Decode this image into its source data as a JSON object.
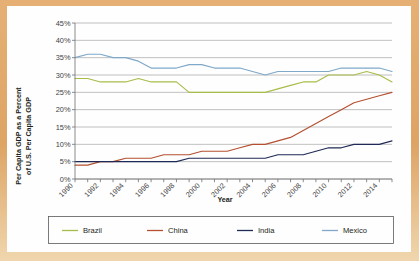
{
  "figure": {
    "background_color": "#e2ab71",
    "panel_color": "#fefefe",
    "ylabel_line1": "Per Capita GDP as a Percent",
    "ylabel_line2": "of U.S. Per Capita GDP",
    "xlabel": "Year"
  },
  "chart_data": {
    "type": "line",
    "title": "",
    "xlabel": "Year",
    "ylabel": "Per Capita GDP as a Percent of U.S. Per Capita GDP",
    "grid": true,
    "legend_position": "bottom",
    "xlim": [
      1990,
      2015
    ],
    "ylim": [
      0,
      45
    ],
    "ytick_labels": [
      "0%",
      "5%",
      "10%",
      "15%",
      "20%",
      "25%",
      "30%",
      "35%",
      "40%",
      "45%"
    ],
    "ytick_values": [
      0,
      5,
      10,
      15,
      20,
      25,
      30,
      35,
      40,
      45
    ],
    "xtick_labels": [
      "1990",
      "1992",
      "1994",
      "1996",
      "1998",
      "2000",
      "2002",
      "2004",
      "2006",
      "2008",
      "2010",
      "2012",
      "2014"
    ],
    "xtick_values": [
      1990,
      1992,
      1994,
      1996,
      1998,
      2000,
      2002,
      2004,
      2006,
      2008,
      2010,
      2012,
      2014
    ],
    "x": [
      1990,
      1991,
      1992,
      1993,
      1994,
      1995,
      1996,
      1997,
      1998,
      1999,
      2000,
      2001,
      2002,
      2003,
      2004,
      2005,
      2006,
      2007,
      2008,
      2009,
      2010,
      2011,
      2012,
      2013,
      2014,
      2015
    ],
    "series": [
      {
        "name": "Brazil",
        "color": "#a7bd4a",
        "values": [
          29,
          29,
          28,
          28,
          28,
          29,
          28,
          28,
          28,
          25,
          25,
          25,
          25,
          25,
          25,
          25,
          26,
          27,
          28,
          28,
          30,
          30,
          30,
          31,
          30,
          28
        ]
      },
      {
        "name": "China",
        "color": "#b4502f",
        "values": [
          4,
          4,
          5,
          5,
          6,
          6,
          6,
          7,
          7,
          7,
          8,
          8,
          8,
          9,
          10,
          10,
          11,
          12,
          14,
          16,
          18,
          20,
          22,
          23,
          24,
          25
        ]
      },
      {
        "name": "India",
        "color": "#1f2a56",
        "values": [
          5,
          5,
          5,
          5,
          5,
          5,
          5,
          5,
          5,
          6,
          6,
          6,
          6,
          6,
          6,
          6,
          7,
          7,
          7,
          8,
          9,
          9,
          10,
          10,
          10,
          11
        ]
      },
      {
        "name": "Mexico",
        "color": "#7fa8c9",
        "values": [
          35,
          36,
          36,
          35,
          35,
          34,
          32,
          32,
          32,
          33,
          33,
          32,
          32,
          32,
          31,
          30,
          31,
          31,
          31,
          31,
          31,
          32,
          32,
          32,
          32,
          31
        ]
      }
    ]
  },
  "legend": {
    "items": [
      {
        "label": "Brazil",
        "color": "#a7bd4a"
      },
      {
        "label": "China",
        "color": "#b4502f"
      },
      {
        "label": "India",
        "color": "#1f2a56"
      },
      {
        "label": "Mexico",
        "color": "#7fa8c9"
      }
    ]
  }
}
